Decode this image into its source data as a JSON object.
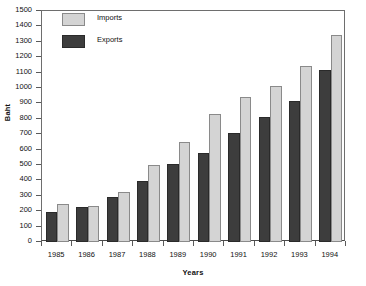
{
  "chart_data": {
    "type": "bar",
    "title": "",
    "xlabel": "Years",
    "ylabel": "Baht",
    "categories": [
      "1985",
      "1986",
      "1987",
      "1988",
      "1989",
      "1990",
      "1991",
      "1992",
      "1993",
      "1994"
    ],
    "series": [
      {
        "name": "Imports",
        "color": "#d4d4d4",
        "values": [
          245,
          235,
          325,
          500,
          650,
          830,
          940,
          1010,
          1145,
          1345
        ]
      },
      {
        "name": "Exports",
        "color": "#3d3d3d",
        "values": [
          192,
          228,
          295,
          395,
          505,
          578,
          710,
          810,
          915,
          1115
        ]
      }
    ],
    "ylim": [
      0,
      1500
    ],
    "ytick_step": 100,
    "yticks": [
      0,
      100,
      200,
      300,
      400,
      500,
      600,
      700,
      800,
      900,
      1000,
      1100,
      1200,
      1300,
      1400,
      1500
    ],
    "grid": false,
    "legend_position": "top-left"
  }
}
